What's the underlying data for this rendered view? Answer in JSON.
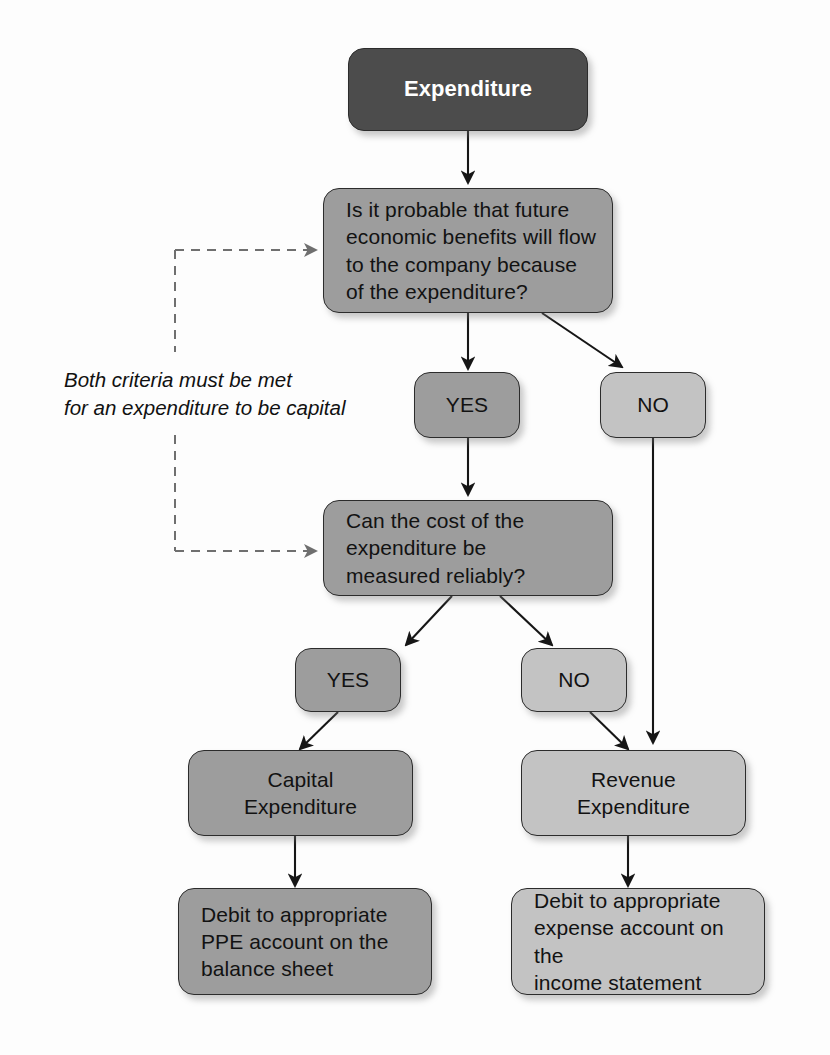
{
  "diagram": {
    "title_node": {
      "id": "expenditure",
      "text": "Expenditure",
      "shade": "dark"
    },
    "decisions": [
      {
        "id": "decision-probable-benefits",
        "text": "Is it probable that future\neconomic benefits will flow\nto the company because\nof the expenditure?",
        "shade": "mid"
      },
      {
        "id": "decision-measured-reliably",
        "text": "Can the cost of the\nexpenditure be\nmeasured reliably?",
        "shade": "mid"
      }
    ],
    "answers": [
      {
        "id": "answer-yes-1",
        "text": "YES",
        "shade": "mid"
      },
      {
        "id": "answer-no-1",
        "text": "NO",
        "shade": "light"
      },
      {
        "id": "answer-yes-2",
        "text": "YES",
        "shade": "mid"
      },
      {
        "id": "answer-no-2",
        "text": "NO",
        "shade": "light"
      }
    ],
    "outcomes": [
      {
        "id": "outcome-capital",
        "text": "Capital\nExpenditure",
        "shade": "mid"
      },
      {
        "id": "outcome-revenue",
        "text": "Revenue\nExpenditure",
        "shade": "light"
      }
    ],
    "actions": [
      {
        "id": "action-debit-ppe",
        "text": "Debit to appropriate\nPPE account on the\nbalance sheet",
        "shade": "mid"
      },
      {
        "id": "action-debit-expense",
        "text": "Debit to appropriate\nexpense account on the\nincome statement",
        "shade": "light"
      }
    ],
    "annotation": {
      "id": "annotation-both-criteria",
      "text": "Both criteria must be met\nfor an expenditure to be capital"
    },
    "colors": {
      "dark": "#4c4c4c",
      "mid": "#9d9d9d",
      "light": "#c3c3c3",
      "stroke": "#2c2c2c",
      "dashed": "#6f6f6f",
      "background": "#fdfdfd",
      "text_light": "#ffffff",
      "text_dark": "#121212"
    }
  }
}
